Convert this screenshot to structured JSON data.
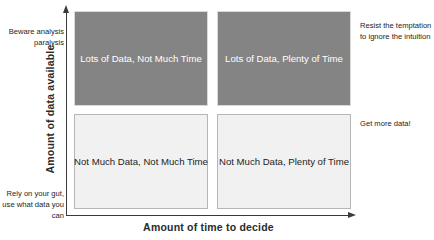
{
  "chart_data": {
    "type": "table",
    "title": "",
    "xlabel": "Amount of time to decide",
    "ylabel": "Amount of data available",
    "grid": false,
    "legend": "none",
    "x_axis_range": [
      "Not Much Time",
      "Plenty of Time"
    ],
    "y_axis_range": [
      "Not Much Data",
      "Lots of Data"
    ],
    "categories": [
      "Not Much Time",
      "Plenty of Time"
    ],
    "rows": [
      "Lots of Data",
      "Not Much Data"
    ],
    "cells": [
      {
        "row": "Lots of Data",
        "column": "Not Much Time",
        "label": "Lots of Data, Not Much Time",
        "fill": "#848484",
        "text_color": "#ffffff",
        "advice": "Beware analysis paralysis"
      },
      {
        "row": "Lots of Data",
        "column": "Plenty of Time",
        "label": "Lots of Data, Plenty of Time",
        "fill": "#848484",
        "text_color": "#ffffff",
        "advice": "Resist the temptation to ignore the intuition"
      },
      {
        "row": "Not Much Data",
        "column": "Not Much Time",
        "label": "Not Much Data, Not Much Time",
        "fill": "#f1f1f1",
        "text_color": "#1d1d1d",
        "advice": "Rely on your gut, use what data you can"
      },
      {
        "row": "Not Much Data",
        "column": "Plenty of Time",
        "label": "Not Much Data, Plenty of Time",
        "fill": "#f1f1f1",
        "text_color": "#1d1d1d",
        "advice": "Get more data!"
      }
    ]
  },
  "axes": {
    "x_title": "Amount of time to decide",
    "y_title": "Amount of data available",
    "line_color": "#3a3a3a"
  },
  "quadrants": {
    "top_left": {
      "label": "Lots of Data, Not Much Time"
    },
    "top_right": {
      "label": "Lots of Data, Plenty of Time"
    },
    "bottom_left": {
      "label": "Not Much Data, Not Much Time"
    },
    "bottom_right": {
      "label": "Not Much Data, Plenty of Time"
    }
  },
  "annotations": {
    "top_left": "Beware analysis paralysis",
    "bottom_left": "Rely on your gut, use what data you can",
    "top_right": "Resist the temptation to ignore the intuition",
    "mid_right": "Get more data!"
  },
  "colors": {
    "dark_cell": "#848484",
    "light_cell": "#f1f1f1",
    "axis": "#3a3a3a",
    "background": "#ffffff"
  }
}
